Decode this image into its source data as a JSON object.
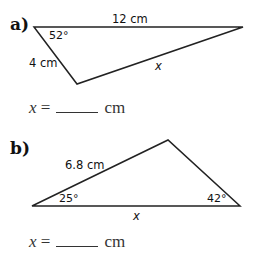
{
  "problems": [
    {
      "label": "a)",
      "triangle": {
        "side_top": "12 cm",
        "side_left": "4 cm",
        "side_unknown": "x",
        "angle": "52°"
      },
      "answer": {
        "variable": "x",
        "equals": "=",
        "unit": "cm"
      }
    },
    {
      "label": "b)",
      "triangle": {
        "side_left": "6.8 cm",
        "side_unknown": "x",
        "angle_left": "25°",
        "angle_right": "42°"
      },
      "answer": {
        "variable": "x",
        "equals": "=",
        "unit": "cm"
      }
    }
  ]
}
